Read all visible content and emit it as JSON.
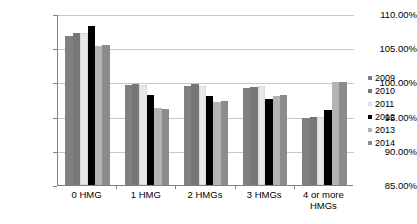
{
  "chart_data": {
    "type": "bar",
    "title": "",
    "subtitle": "",
    "xlabel": "",
    "ylabel": "",
    "ylim": [
      85,
      110
    ],
    "ytick_step": 5,
    "ytick_labels": [
      "110.00%",
      "105.00%",
      "100.00%",
      "95.00%",
      "90.00%",
      "85.00%"
    ],
    "ytick_values": [
      110,
      105,
      100,
      95,
      90,
      85
    ],
    "grid": true,
    "legend_position": "right",
    "value_suffix": "%",
    "categories": [
      "0 HMG",
      "1 HMG",
      "2 HMGs",
      "3 HMGs",
      "4 or more HMGs"
    ],
    "series": [
      {
        "name": "2009",
        "color": "#808080",
        "values": [
          106.8,
          99.6,
          99.5,
          99.2,
          94.8
        ]
      },
      {
        "name": "2010",
        "color": "#777777",
        "values": [
          107.2,
          99.7,
          99.8,
          99.4,
          95.0
        ]
      },
      {
        "name": "2011",
        "color": "#e8e8e8",
        "values": [
          107.2,
          99.6,
          99.5,
          99.5,
          94.9
        ]
      },
      {
        "name": "2012",
        "color": "#000000",
        "values": [
          108.3,
          98.2,
          98.0,
          97.6,
          96.0
        ]
      },
      {
        "name": "2013",
        "color": "#b4b4b4",
        "values": [
          105.3,
          96.3,
          97.2,
          98.0,
          100.0
        ]
      },
      {
        "name": "2014",
        "color": "#8c8c8c",
        "values": [
          105.5,
          96.1,
          97.3,
          98.2,
          100.0
        ]
      }
    ]
  },
  "legend": {
    "items": [
      {
        "label": "2009"
      },
      {
        "label": "2010"
      },
      {
        "label": "2011"
      },
      {
        "label": "2012"
      },
      {
        "label": "2013"
      },
      {
        "label": "2014"
      }
    ]
  },
  "axis": {
    "line_color": "#808080",
    "grid_color": "#c8c8c8"
  }
}
